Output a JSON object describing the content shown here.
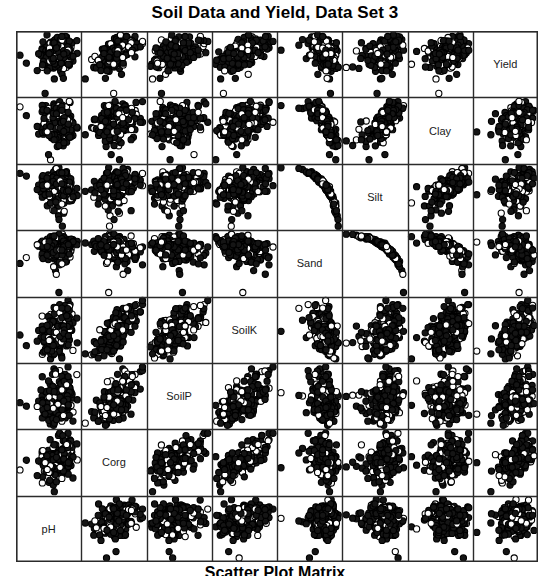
{
  "title": "Soil Data and Yield, Data Set 3",
  "caption": "Scatter Plot Matrix",
  "chart_data": {
    "type": "scatter",
    "title": "Soil Data and Yield, Data Set 3",
    "subtitle": "Scatter Plot Matrix",
    "matrix": true,
    "n_variables": 8,
    "n_points_per_panel": 230,
    "grid": true,
    "legend": "none",
    "xlabel": "",
    "ylabel": "",
    "marker": {
      "shape": "circle",
      "fill": "#151515",
      "stroke": "#000000",
      "radius": 3.1,
      "open_fraction": 0.22
    },
    "panel_background": "#ffffff",
    "panel_border": "#2b2b2b",
    "variables": [
      "pH",
      "Corg",
      "SoilP",
      "SoilK",
      "Sand",
      "Silt",
      "Clay",
      "Yield"
    ],
    "diagonal_labels": [
      "pH",
      "Corg",
      "SoilP",
      "SoilK",
      "Sand",
      "Silt",
      "Clay",
      "Yield"
    ],
    "diagonal_order": "bottom-left to top-right",
    "correlations": [
      [
        1.0,
        0.15,
        0.1,
        0.22,
        0.08,
        -0.06,
        -0.04,
        0.12
      ],
      [
        0.15,
        1.0,
        0.3,
        0.38,
        -0.18,
        0.16,
        0.14,
        0.26
      ],
      [
        0.1,
        0.3,
        1.0,
        0.34,
        -0.1,
        0.12,
        0.06,
        0.2
      ],
      [
        0.22,
        0.38,
        0.34,
        1.0,
        -0.24,
        0.22,
        0.2,
        0.28
      ],
      [
        0.08,
        -0.18,
        -0.1,
        -0.24,
        1.0,
        -0.94,
        -0.55,
        -0.22
      ],
      [
        -0.06,
        0.16,
        0.12,
        0.22,
        -0.94,
        1.0,
        0.3,
        0.24
      ],
      [
        -0.04,
        0.14,
        0.06,
        0.2,
        -0.55,
        0.3,
        1.0,
        0.18
      ],
      [
        0.12,
        0.26,
        0.2,
        0.28,
        -0.22,
        0.24,
        0.18,
        1.0
      ]
    ],
    "skews": [
      0.55,
      0.85,
      1.35,
      0.95,
      0.35,
      0.45,
      0.75,
      0.4
    ],
    "axis_ranges": {
      "pH": [
        0,
        1
      ],
      "Corg": [
        0,
        1
      ],
      "SoilP": [
        0,
        1
      ],
      "SoilK": [
        0,
        1
      ],
      "Sand": [
        0,
        1
      ],
      "Silt": [
        0,
        1
      ],
      "Clay": [
        0,
        1
      ],
      "Yield": [
        0,
        1
      ]
    },
    "tick_labels_shown": false
  }
}
